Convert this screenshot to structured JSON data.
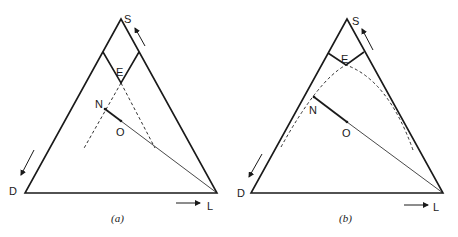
{
  "figure": {
    "panels": [
      {
        "id": "a",
        "caption": "(a)",
        "vertices": {
          "S": "S",
          "D": "D",
          "L": "L"
        },
        "points": {
          "E": "E",
          "N": "N",
          "O": "O"
        },
        "boundary_style": "straight dashed lines from E"
      },
      {
        "id": "b",
        "caption": "(b)",
        "vertices": {
          "S": "S",
          "D": "D",
          "L": "L"
        },
        "points": {
          "E": "E",
          "N": "N",
          "O": "O"
        },
        "boundary_style": "curved dashed line through E"
      }
    ],
    "colors": {
      "stroke": "#1a1a1a",
      "background": "#ffffff"
    }
  }
}
